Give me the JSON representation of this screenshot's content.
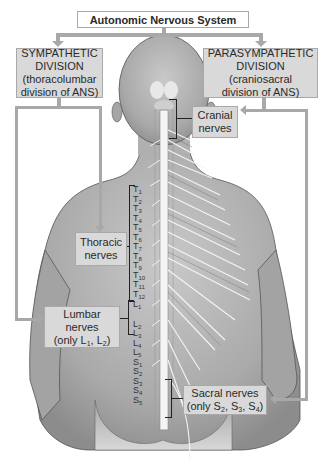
{
  "title": "Autonomic Nervous System",
  "sympathetic": {
    "line1": "SYMPATHETIC",
    "line2": "DIVISION",
    "line3": "(thoracolumbar",
    "line4": "division of ANS)"
  },
  "parasympathetic": {
    "line1": "PARASYMPATHETIC",
    "line2": "DIVISION",
    "line3": "(craniosacral",
    "line4": "division of ANS)"
  },
  "cranial": {
    "line1": "Cranial",
    "line2": "nerves"
  },
  "thoracic": {
    "line1": "Thoracic",
    "line2": "nerves"
  },
  "lumbar": {
    "line1": "Lumbar",
    "line2": "nerves",
    "line3_prefix": "(only L",
    "sub1": "1",
    "mid": ", L",
    "sub2": "2",
    "suffix": ")"
  },
  "sacral": {
    "line1": "Sacral nerves",
    "line2_prefix": "(only S",
    "s2": "2",
    "sep1": ", S",
    "s3": "3",
    "sep2": ", S",
    "s4": "4",
    "suffix": ")"
  },
  "segments": {
    "thoracic": [
      "1",
      "2",
      "3",
      "4",
      "5",
      "6",
      "7",
      "8",
      "9",
      "10",
      "11",
      "12"
    ],
    "thoracic_letter": "T",
    "lumbar": [
      "1",
      "2",
      "3",
      "4",
      "5"
    ],
    "lumbar_letter": "L",
    "sacral": [
      "1",
      "2",
      "3",
      "4",
      "5"
    ],
    "sacral_letter": "S"
  },
  "colors": {
    "box_fill": "#d9d9d9",
    "connector": "#a8a8a8",
    "skin": "#b8b8b8",
    "nerve": "#f2f2f2"
  }
}
